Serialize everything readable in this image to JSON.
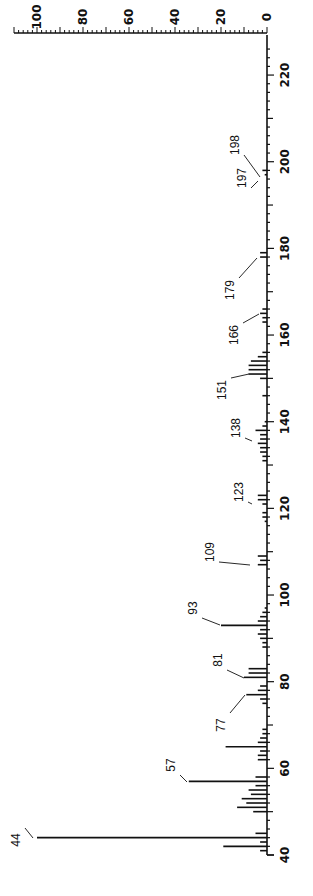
{
  "chart_data": {
    "type": "bar",
    "title": "",
    "orientation": "rotated-90 (m/z axis vertical on right, intensity axis horizontal on top)",
    "xlabel": "m/z",
    "ylabel": "Relative intensity (%)",
    "xlim": [
      40,
      225
    ],
    "ylim": [
      0,
      110
    ],
    "x_ticks": [
      40,
      60,
      80,
      100,
      120,
      140,
      160,
      180,
      200,
      220
    ],
    "y_ticks": [
      0,
      20,
      40,
      60,
      80,
      100
    ],
    "grid": false,
    "legend": null,
    "peaks": [
      {
        "mz": 41,
        "intensity": 3
      },
      {
        "mz": 42,
        "intensity": 19
      },
      {
        "mz": 43,
        "intensity": 3
      },
      {
        "mz": 44,
        "intensity": 100,
        "label": "44"
      },
      {
        "mz": 45,
        "intensity": 5
      },
      {
        "mz": 50,
        "intensity": 6
      },
      {
        "mz": 51,
        "intensity": 13
      },
      {
        "mz": 52,
        "intensity": 9
      },
      {
        "mz": 53,
        "intensity": 11
      },
      {
        "mz": 54,
        "intensity": 7
      },
      {
        "mz": 55,
        "intensity": 8
      },
      {
        "mz": 56,
        "intensity": 5
      },
      {
        "mz": 57,
        "intensity": 34,
        "label": "57"
      },
      {
        "mz": 58,
        "intensity": 5
      },
      {
        "mz": 62,
        "intensity": 4
      },
      {
        "mz": 63,
        "intensity": 4
      },
      {
        "mz": 64,
        "intensity": 3
      },
      {
        "mz": 65,
        "intensity": 18
      },
      {
        "mz": 66,
        "intensity": 4
      },
      {
        "mz": 67,
        "intensity": 3
      },
      {
        "mz": 68,
        "intensity": 2
      },
      {
        "mz": 69,
        "intensity": 2
      },
      {
        "mz": 75,
        "intensity": 2
      },
      {
        "mz": 76,
        "intensity": 3
      },
      {
        "mz": 77,
        "intensity": 9,
        "label": "77"
      },
      {
        "mz": 78,
        "intensity": 4
      },
      {
        "mz": 79,
        "intensity": 3
      },
      {
        "mz": 81,
        "intensity": 10,
        "label": "81"
      },
      {
        "mz": 82,
        "intensity": 8
      },
      {
        "mz": 83,
        "intensity": 8
      },
      {
        "mz": 88,
        "intensity": 2
      },
      {
        "mz": 89,
        "intensity": 2
      },
      {
        "mz": 90,
        "intensity": 3
      },
      {
        "mz": 91,
        "intensity": 4
      },
      {
        "mz": 92,
        "intensity": 3
      },
      {
        "mz": 93,
        "intensity": 20,
        "label": "93"
      },
      {
        "mz": 94,
        "intensity": 4
      },
      {
        "mz": 95,
        "intensity": 3
      },
      {
        "mz": 96,
        "intensity": 2
      },
      {
        "mz": 97,
        "intensity": 1
      },
      {
        "mz": 107,
        "intensity": 4
      },
      {
        "mz": 108,
        "intensity": 3
      },
      {
        "mz": 109,
        "intensity": 4,
        "label": "109"
      },
      {
        "mz": 117,
        "intensity": 1
      },
      {
        "mz": 118,
        "intensity": 2
      },
      {
        "mz": 119,
        "intensity": 2
      },
      {
        "mz": 121,
        "intensity": 2
      },
      {
        "mz": 122,
        "intensity": 4
      },
      {
        "mz": 123,
        "intensity": 4,
        "label": "123"
      },
      {
        "mz": 131,
        "intensity": 2
      },
      {
        "mz": 132,
        "intensity": 2
      },
      {
        "mz": 133,
        "intensity": 3
      },
      {
        "mz": 134,
        "intensity": 3
      },
      {
        "mz": 135,
        "intensity": 4
      },
      {
        "mz": 136,
        "intensity": 3
      },
      {
        "mz": 137,
        "intensity": 3
      },
      {
        "mz": 138,
        "intensity": 5,
        "label": "138"
      },
      {
        "mz": 139,
        "intensity": 2
      },
      {
        "mz": 140,
        "intensity": 1
      },
      {
        "mz": 146,
        "intensity": 2
      },
      {
        "mz": 150,
        "intensity": 3
      },
      {
        "mz": 151,
        "intensity": 8,
        "label": "151"
      },
      {
        "mz": 152,
        "intensity": 8
      },
      {
        "mz": 153,
        "intensity": 8
      },
      {
        "mz": 154,
        "intensity": 7
      },
      {
        "mz": 155,
        "intensity": 4
      },
      {
        "mz": 156,
        "intensity": 2
      },
      {
        "mz": 163,
        "intensity": 2
      },
      {
        "mz": 164,
        "intensity": 2
      },
      {
        "mz": 165,
        "intensity": 3
      },
      {
        "mz": 166,
        "intensity": 2,
        "label": "166"
      },
      {
        "mz": 178,
        "intensity": 3
      },
      {
        "mz": 179,
        "intensity": 3,
        "label": "179"
      },
      {
        "mz": 197,
        "intensity": 1,
        "label": "197"
      },
      {
        "mz": 198,
        "intensity": 2,
        "label": "198"
      }
    ]
  },
  "axes": {
    "intensity_tick_labels": [
      "100",
      "80",
      "60",
      "40",
      "20",
      "0"
    ],
    "mz_tick_labels": [
      "40",
      "60",
      "80",
      "100",
      "120",
      "140",
      "160",
      "180",
      "200",
      "220"
    ]
  },
  "peak_labels": [
    "44",
    "57",
    "77",
    "81",
    "93",
    "109",
    "123",
    "138",
    "151",
    "166",
    "179",
    "197",
    "198"
  ]
}
